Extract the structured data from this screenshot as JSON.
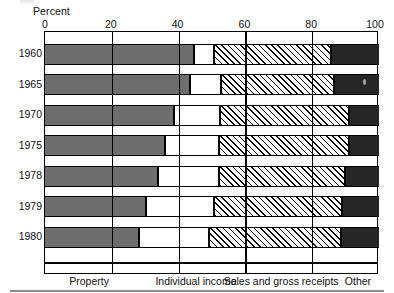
{
  "chart_data": {
    "type": "bar",
    "orientation": "horizontal",
    "stacked": true,
    "title": "",
    "xlabel": "Percent",
    "ylabel": "",
    "xlim": [
      0,
      100
    ],
    "xticks": [
      0,
      20,
      40,
      60,
      80,
      100
    ],
    "xtick_labels": [
      "0",
      "20",
      "40",
      "60",
      "80",
      "100"
    ],
    "grid": true,
    "legend_position": "bottom",
    "categories": [
      "1960",
      "1965",
      "1970",
      "1975",
      "1978",
      "1979",
      "1980"
    ],
    "series": [
      {
        "name": "Property",
        "fill": "solid-gray",
        "color": "#6e6e6e",
        "values": [
          44.6,
          43.4,
          38.6,
          35.9,
          33.8,
          30.2,
          28.1
        ]
      },
      {
        "name": "Individual income",
        "fill": "solid-white",
        "color": "#ffffff",
        "values": [
          6.0,
          9.3,
          13.8,
          16.2,
          18.3,
          20.4,
          21.0
        ]
      },
      {
        "name": "Sales and gross receipts",
        "fill": "diagonal-hatch",
        "color": "#ffffff",
        "values": [
          35.0,
          33.8,
          38.6,
          38.9,
          37.7,
          38.3,
          39.5
        ]
      },
      {
        "name": "Other",
        "fill": "solid-black",
        "color": "#262626",
        "values": [
          14.4,
          13.5,
          9.0,
          9.0,
          10.2,
          11.1,
          11.4
        ]
      }
    ],
    "cumulative_boundaries": [
      [
        44.6,
        50.6,
        85.6,
        100.0
      ],
      [
        43.4,
        52.7,
        86.5,
        100.0
      ],
      [
        38.6,
        52.4,
        91.0,
        100.0
      ],
      [
        35.9,
        52.1,
        91.0,
        100.0
      ],
      [
        33.8,
        52.1,
        89.8,
        100.0
      ],
      [
        30.2,
        50.6,
        88.9,
        100.0
      ],
      [
        28.1,
        49.1,
        88.6,
        100.0
      ]
    ]
  },
  "axis": {
    "title": "Percent",
    "ticks": [
      {
        "label": "0",
        "value": 0
      },
      {
        "label": "20",
        "value": 20
      },
      {
        "label": "40",
        "value": 40
      },
      {
        "label": "60",
        "value": 60
      },
      {
        "label": "80",
        "value": 80
      },
      {
        "label": "100",
        "value": 100
      }
    ]
  },
  "years": [
    "1960",
    "1965",
    "1970",
    "1975",
    "1978",
    "1979",
    "1980"
  ],
  "legend": {
    "items": [
      {
        "label": "Property",
        "center": 13.5
      },
      {
        "label": "Individual income",
        "center": 45.5
      },
      {
        "label": "Sales and gross receipts",
        "center": 71.0
      },
      {
        "label": "Other",
        "center": 94.0
      }
    ],
    "dividers": [
      20,
      40,
      60,
      80
    ]
  },
  "colors": {
    "property": "#6e6e6e",
    "individual_income": "#ffffff",
    "sales_hatch": "#000000",
    "other": "#262626",
    "axis": "#000000",
    "background": "#ffffff"
  }
}
